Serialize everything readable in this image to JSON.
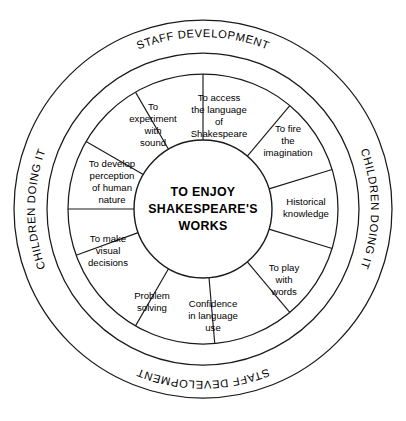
{
  "diagram": {
    "center": {
      "lines": [
        "TO ENJOY",
        "SHAKESPEARE'S",
        "WORKS"
      ]
    },
    "segments": [
      {
        "id": "access-language",
        "lines": [
          "To access",
          "the language",
          "of",
          "Shakespeare"
        ]
      },
      {
        "id": "fire-imagination",
        "lines": [
          "To fire",
          "the",
          "imagination"
        ]
      },
      {
        "id": "historical-knowledge",
        "lines": [
          "Historical",
          "knowledge"
        ]
      },
      {
        "id": "play-with-words",
        "lines": [
          "To play",
          "with",
          "words"
        ]
      },
      {
        "id": "confidence-language",
        "lines": [
          "Confidence",
          "in language",
          "use"
        ]
      },
      {
        "id": "problem-solving",
        "lines": [
          "Problem",
          "solving"
        ]
      },
      {
        "id": "visual-decisions",
        "lines": [
          "To make",
          "visual",
          "decisions"
        ]
      },
      {
        "id": "perception-human-nature",
        "lines": [
          "To develop",
          "perception",
          "of human",
          "nature"
        ]
      },
      {
        "id": "experiment-with-sound",
        "lines": [
          "To",
          "experiment",
          "with",
          "sound"
        ]
      }
    ],
    "ring_labels": {
      "top": "STAFF DEVELOPMENT",
      "bottom": "STAFF DEVELOPMENT",
      "left": "CHILDREN DOING IT",
      "right": "CHILDREN DOING IT"
    },
    "colors": {
      "stroke": "#1a1a1a",
      "background": "#ffffff",
      "text": "#000000"
    }
  }
}
